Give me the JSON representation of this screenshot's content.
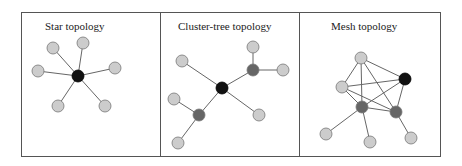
{
  "colors": {
    "border": "#555555",
    "edge": "#666666",
    "node_light": "#cccccc",
    "node_dark": "#666666",
    "node_coordinator": "#111111",
    "node_stroke": "#777777"
  },
  "frame": {
    "x": 21,
    "y": 12,
    "w": 419,
    "h": 144,
    "dividers": [
      160,
      299
    ]
  },
  "panels": [
    {
      "title": "Star topology",
      "title_pos": [
        45,
        30
      ],
      "nodes": [
        {
          "id": "c",
          "x": 78,
          "y": 76,
          "type": "coordinator"
        },
        {
          "id": "a",
          "x": 53,
          "y": 48,
          "type": "light"
        },
        {
          "id": "b",
          "x": 83,
          "y": 43,
          "type": "light"
        },
        {
          "id": "d",
          "x": 38,
          "y": 71,
          "type": "light"
        },
        {
          "id": "e",
          "x": 115,
          "y": 68,
          "type": "light"
        },
        {
          "id": "f",
          "x": 58,
          "y": 106,
          "type": "light"
        },
        {
          "id": "g",
          "x": 105,
          "y": 106,
          "type": "light"
        }
      ],
      "edges": [
        [
          "c",
          "a"
        ],
        [
          "c",
          "b"
        ],
        [
          "c",
          "d"
        ],
        [
          "c",
          "e"
        ],
        [
          "c",
          "f"
        ],
        [
          "c",
          "g"
        ]
      ]
    },
    {
      "title": "Cluster-tree topology",
      "title_pos": [
        178,
        30
      ],
      "nodes": [
        {
          "id": "c",
          "x": 222,
          "y": 88,
          "type": "coordinator"
        },
        {
          "id": "r1",
          "x": 253,
          "y": 70,
          "type": "dark"
        },
        {
          "id": "r2",
          "x": 199,
          "y": 115,
          "type": "dark"
        },
        {
          "id": "l1",
          "x": 253,
          "y": 47,
          "type": "light"
        },
        {
          "id": "l2",
          "x": 283,
          "y": 70,
          "type": "light"
        },
        {
          "id": "l3",
          "x": 182,
          "y": 61,
          "type": "light"
        },
        {
          "id": "l4",
          "x": 259,
          "y": 115,
          "type": "light"
        },
        {
          "id": "l5",
          "x": 174,
          "y": 99,
          "type": "light"
        },
        {
          "id": "l6",
          "x": 178,
          "y": 143,
          "type": "light"
        }
      ],
      "edges": [
        [
          "c",
          "r1"
        ],
        [
          "c",
          "r2"
        ],
        [
          "c",
          "l3"
        ],
        [
          "c",
          "l4"
        ],
        [
          "r1",
          "l1"
        ],
        [
          "r1",
          "l2"
        ],
        [
          "r2",
          "l5"
        ],
        [
          "r2",
          "l6"
        ]
      ]
    },
    {
      "title": "Mesh topology",
      "title_pos": [
        331,
        30
      ],
      "nodes": [
        {
          "id": "t",
          "x": 361,
          "y": 58,
          "type": "light"
        },
        {
          "id": "c",
          "x": 405,
          "y": 79,
          "type": "coordinator"
        },
        {
          "id": "l",
          "x": 342,
          "y": 87,
          "type": "light"
        },
        {
          "id": "d1",
          "x": 362,
          "y": 107,
          "type": "dark"
        },
        {
          "id": "d2",
          "x": 396,
          "y": 112,
          "type": "dark"
        },
        {
          "id": "e1",
          "x": 326,
          "y": 134,
          "type": "light"
        },
        {
          "id": "e2",
          "x": 370,
          "y": 142,
          "type": "light"
        },
        {
          "id": "e3",
          "x": 411,
          "y": 138,
          "type": "light"
        }
      ],
      "edges": [
        [
          "t",
          "c"
        ],
        [
          "t",
          "l"
        ],
        [
          "t",
          "d1"
        ],
        [
          "t",
          "d2"
        ],
        [
          "l",
          "c"
        ],
        [
          "l",
          "d1"
        ],
        [
          "l",
          "d2"
        ],
        [
          "c",
          "d1"
        ],
        [
          "c",
          "d2"
        ],
        [
          "d1",
          "d2"
        ],
        [
          "d1",
          "e1"
        ],
        [
          "d1",
          "e2"
        ],
        [
          "d2",
          "e3"
        ]
      ]
    }
  ],
  "node_radius": 6
}
